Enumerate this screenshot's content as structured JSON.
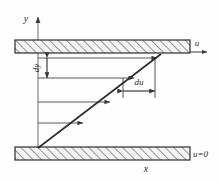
{
  "figure": {
    "colors": {
      "line": "#2b2b2b",
      "plate_fill": "#f2f2f2",
      "hatch": "#3a3a3a",
      "arrow": "#4a4a4a",
      "background": "#fefefe"
    },
    "axes": {
      "y_label": "y",
      "x_label": "x"
    },
    "labels": {
      "u_top": "u",
      "u_bottom": "u=0",
      "dy": "dy",
      "du": "du"
    },
    "plates": [
      {
        "name": "top-plate",
        "x": 15,
        "y": 40,
        "width": 175,
        "height": 13
      },
      {
        "name": "bottom-plate",
        "x": 15,
        "y": 147,
        "width": 175,
        "height": 13
      }
    ],
    "velocity_arrows": [
      {
        "y": 123,
        "x_start": 38,
        "x_end": 83
      },
      {
        "y": 102,
        "x_start": 38,
        "x_end": 110
      },
      {
        "y": 78,
        "x_start": 38,
        "x_end": 134
      },
      {
        "y": 58,
        "x_start": 38,
        "x_end": 157
      }
    ],
    "profile_line": {
      "x1": 38,
      "y1": 147,
      "x2": 160,
      "y2": 55
    },
    "dimension_dy": {
      "x": 47,
      "y_top": 58,
      "y_bottom": 78
    },
    "dimension_du": {
      "y": 90,
      "x_left": 123,
      "x_right": 155
    }
  }
}
